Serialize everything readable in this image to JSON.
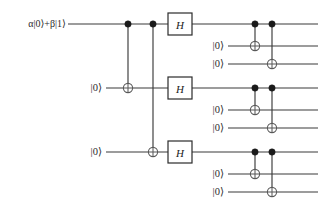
{
  "diagram": {
    "width": 336,
    "height": 213,
    "background": "#ffffff",
    "wire_color": "#3a3a3a",
    "control_color": "#1a1a1a",
    "target_color": "#5a5a5a",
    "gate_border_color": "#2b2b2b"
  },
  "labels": {
    "input_state": "α|0⟩+β|1⟩",
    "ancilla_zero": "|0⟩",
    "hadamard": "H"
  },
  "wires": [
    {
      "id": "q0",
      "index": 0,
      "y": 24,
      "label": "α|0⟩+β|1⟩",
      "label_x": 66,
      "x_start": 68,
      "x_end": 318,
      "is_input": true
    },
    {
      "id": "q1",
      "index": 1,
      "y": 46,
      "label": "|0⟩",
      "label_x": 224,
      "x_start": 228,
      "x_end": 318,
      "is_input": false
    },
    {
      "id": "q2",
      "index": 2,
      "y": 64,
      "label": "|0⟩",
      "label_x": 224,
      "x_start": 228,
      "x_end": 318,
      "is_input": false
    },
    {
      "id": "q3",
      "index": 3,
      "y": 88,
      "label": "|0⟩",
      "label_x": 102,
      "x_start": 106,
      "x_end": 318,
      "is_input": false
    },
    {
      "id": "q4",
      "index": 4,
      "y": 110,
      "label": "|0⟩",
      "label_x": 224,
      "x_start": 228,
      "x_end": 318,
      "is_input": false
    },
    {
      "id": "q5",
      "index": 5,
      "y": 128,
      "label": "|0⟩",
      "label_x": 224,
      "x_start": 228,
      "x_end": 318,
      "is_input": false
    },
    {
      "id": "q6",
      "index": 6,
      "y": 152,
      "label": "|0⟩",
      "label_x": 102,
      "x_start": 106,
      "x_end": 318,
      "is_input": false
    },
    {
      "id": "q7",
      "index": 7,
      "y": 174,
      "label": "|0⟩",
      "label_x": 224,
      "x_start": 228,
      "x_end": 318,
      "is_input": false
    },
    {
      "id": "q8",
      "index": 8,
      "y": 192,
      "label": "|0⟩",
      "label_x": 224,
      "x_start": 228,
      "x_end": 318,
      "is_input": false
    }
  ],
  "gates": [
    {
      "type": "cnot",
      "name": "cnot-q0-q3",
      "x": 128,
      "control_y": 24,
      "target_y": 88
    },
    {
      "type": "cnot",
      "name": "cnot-q0-q6",
      "x": 153,
      "control_y": 24,
      "target_y": 152
    },
    {
      "type": "hadamard",
      "name": "hadamard-q0",
      "x": 180,
      "y": 24,
      "label": "H"
    },
    {
      "type": "hadamard",
      "name": "hadamard-q3",
      "x": 180,
      "y": 88,
      "label": "H"
    },
    {
      "type": "hadamard",
      "name": "hadamard-q6",
      "x": 180,
      "y": 152,
      "label": "H"
    },
    {
      "type": "cnot",
      "name": "cnot-q0-q1",
      "x": 255,
      "control_y": 24,
      "target_y": 46
    },
    {
      "type": "cnot",
      "name": "cnot-q0-q2",
      "x": 272,
      "control_y": 24,
      "target_y": 64
    },
    {
      "type": "cnot",
      "name": "cnot-q3-q4",
      "x": 255,
      "control_y": 88,
      "target_y": 110
    },
    {
      "type": "cnot",
      "name": "cnot-q3-q5",
      "x": 272,
      "control_y": 88,
      "target_y": 128
    },
    {
      "type": "cnot",
      "name": "cnot-q6-q7",
      "x": 255,
      "control_y": 152,
      "target_y": 174
    },
    {
      "type": "cnot",
      "name": "cnot-q6-q8",
      "x": 272,
      "control_y": 152,
      "target_y": 192
    }
  ],
  "gate_box": {
    "width": 24,
    "height": 22
  },
  "control_radius": 3.2,
  "target_radius": 4.6
}
